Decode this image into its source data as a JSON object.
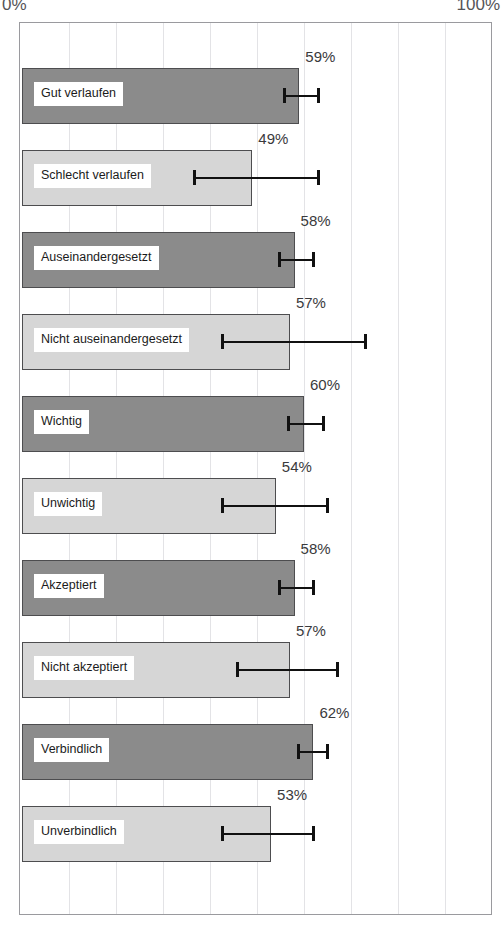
{
  "axis": {
    "min_label": "0%",
    "max_label": "100%"
  },
  "chart_data": {
    "type": "bar",
    "orientation": "horizontal",
    "title": "",
    "xlabel": "",
    "ylabel": "",
    "xlim": [
      0,
      100
    ],
    "xtick_labels": [
      "0%",
      "100%"
    ],
    "grid": true,
    "gridline_interval": 10,
    "legend": "none",
    "units": "%",
    "value_label_suffix": "%",
    "colors": {
      "dark_bar": "#8b8b8b",
      "light_bar": "#d6d6d6",
      "bar_outline": "#4d4d4f",
      "errorbar": "#111111",
      "gridline": "#e3e3e6",
      "frame": "#9a9a9e",
      "label_text": "#1b1b1b",
      "value_text": "#3a3a3c"
    },
    "categories": [
      "Gut verlaufen",
      "Schlecht verlaufen",
      "Auseinandergesetzt",
      "Nicht auseinandergesetzt",
      "Wichtig",
      "Unwichtig",
      "Akzeptiert",
      "Nicht akzeptiert",
      "Verbindlich",
      "Unverbindlich"
    ],
    "values": [
      59,
      49,
      58,
      57,
      60,
      54,
      58,
      57,
      62,
      53
    ],
    "value_labels": [
      "59%",
      "49%",
      "58%",
      "57%",
      "60%",
      "54%",
      "58%",
      "57%",
      "62%",
      "53%"
    ],
    "shades": [
      "dark",
      "light",
      "dark",
      "light",
      "dark",
      "light",
      "dark",
      "light",
      "dark",
      "light"
    ],
    "error_low": [
      55,
      36,
      54,
      42,
      56,
      42,
      54,
      45,
      58,
      42
    ],
    "error_high": [
      63,
      63,
      62,
      73,
      64,
      65,
      62,
      67,
      65,
      62
    ]
  },
  "bars": [
    {
      "label": "Gut verlaufen",
      "value": 59,
      "value_label": "59%",
      "shade": "dark",
      "err_low": 55,
      "err_high": 63
    },
    {
      "label": "Schlecht verlaufen",
      "value": 49,
      "value_label": "49%",
      "shade": "light",
      "err_low": 36,
      "err_high": 63
    },
    {
      "label": "Auseinandergesetzt",
      "value": 58,
      "value_label": "58%",
      "shade": "dark",
      "err_low": 54,
      "err_high": 62
    },
    {
      "label": "Nicht auseinandergesetzt",
      "value": 57,
      "value_label": "57%",
      "shade": "light",
      "err_low": 42,
      "err_high": 73
    },
    {
      "label": "Wichtig",
      "value": 60,
      "value_label": "60%",
      "shade": "dark",
      "err_low": 56,
      "err_high": 64
    },
    {
      "label": "Unwichtig",
      "value": 54,
      "value_label": "54%",
      "shade": "light",
      "err_low": 42,
      "err_high": 65
    },
    {
      "label": "Akzeptiert",
      "value": 58,
      "value_label": "58%",
      "shade": "dark",
      "err_low": 54,
      "err_high": 62
    },
    {
      "label": "Nicht akzeptiert",
      "value": 57,
      "value_label": "57%",
      "shade": "light",
      "err_low": 45,
      "err_high": 67
    },
    {
      "label": "Verbindlich",
      "value": 62,
      "value_label": "62%",
      "shade": "dark",
      "err_low": 58,
      "err_high": 65
    },
    {
      "label": "Unverbindlich",
      "value": 53,
      "value_label": "53%",
      "shade": "light",
      "err_low": 42,
      "err_high": 62
    }
  ]
}
